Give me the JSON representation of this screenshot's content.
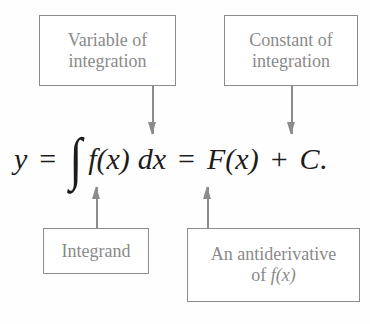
{
  "diagram": {
    "equation": {
      "lhs": "y",
      "equals_1": "=",
      "integral_sign": "∫",
      "integrand": "f(x)",
      "differential": "dx",
      "equals_2": "=",
      "antiderivative": "F(x)",
      "plus": "+",
      "constant": "C",
      "period": "."
    },
    "labels": {
      "variable_of_integration": {
        "line1": "Variable of",
        "line2": "integration",
        "points_to": "dx"
      },
      "constant_of_integration": {
        "line1": "Constant of",
        "line2": "integration",
        "points_to": "C"
      },
      "integrand": {
        "line1": "Integrand",
        "points_to": "f(x)"
      },
      "antiderivative": {
        "line1": "An antiderivative",
        "line2_prefix": "of ",
        "line2_math": "f(x)",
        "points_to": "F(x)"
      }
    },
    "colors": {
      "label_border": "#8c8c8c",
      "label_text": "#8a8a8a",
      "equation_text": "#1c1c1c",
      "background": "#fefefe"
    }
  }
}
